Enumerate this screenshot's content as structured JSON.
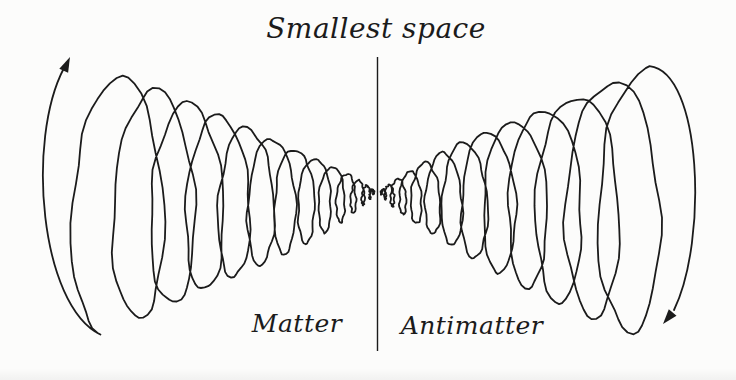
{
  "diagram": {
    "title": "Smallest space",
    "left_label": "Matter",
    "right_label": "Antimatter",
    "ink_color": "#1b1b1b",
    "background_color": "#fcfcfb",
    "icons": {
      "left_arrowhead": "arrowhead-up-icon",
      "right_arrowhead": "arrowhead-down-icon"
    }
  }
}
